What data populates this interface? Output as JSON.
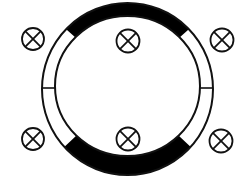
{
  "diagram": {
    "type": "ring-with-symbols",
    "colors": {
      "background": "#ffffff",
      "stroke": "#111111",
      "band": "#000000"
    },
    "ring": {
      "outer": {
        "cx": 127.5,
        "cy": 89,
        "rx": 85.5,
        "ry": 86
      },
      "inner": {
        "cx": 127.5,
        "cy": 86,
        "rx": 72.5,
        "ry": 70
      },
      "segments": [
        {
          "name": "top-band",
          "fill": "black"
        },
        {
          "name": "right-upper-segment",
          "fill": "white"
        },
        {
          "name": "right-lower-segment",
          "fill": "white"
        },
        {
          "name": "bottom-band",
          "fill": "black"
        },
        {
          "name": "left-lower-segment",
          "fill": "white"
        },
        {
          "name": "left-upper-segment",
          "fill": "white"
        }
      ],
      "dividers_y": 88
    },
    "symbols": [
      {
        "name": "crossed-circle-top-left",
        "cx": 33,
        "cy": 39,
        "r": 11
      },
      {
        "name": "crossed-circle-top-center",
        "cx": 128,
        "cy": 41,
        "r": 11.5
      },
      {
        "name": "crossed-circle-top-right",
        "cx": 222,
        "cy": 40,
        "r": 11.5
      },
      {
        "name": "crossed-circle-bottom-left",
        "cx": 33,
        "cy": 139,
        "r": 11
      },
      {
        "name": "crossed-circle-bottom-center",
        "cx": 128,
        "cy": 139,
        "r": 11.5
      },
      {
        "name": "crossed-circle-bottom-right",
        "cx": 221,
        "cy": 141,
        "r": 11.5
      }
    ]
  }
}
